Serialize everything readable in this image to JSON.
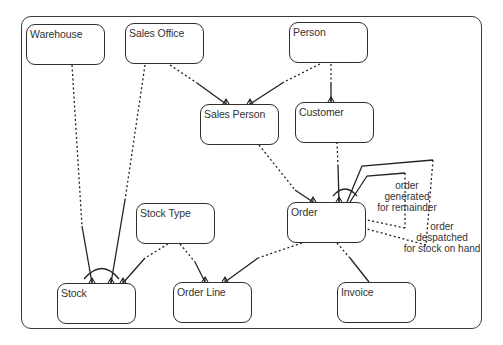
{
  "diagram": {
    "type": "entity-relationship",
    "notation": "Barker (dashed = optional, solid = mandatory, crow's foot = many, arc = exclusive)",
    "entities": [
      {
        "id": "warehouse",
        "label": "Warehouse"
      },
      {
        "id": "sales_office",
        "label": "Sales Office"
      },
      {
        "id": "person",
        "label": "Person"
      },
      {
        "id": "sales_person",
        "label": "Sales Person"
      },
      {
        "id": "customer",
        "label": "Customer"
      },
      {
        "id": "order",
        "label": "Order"
      },
      {
        "id": "stock_type",
        "label": "Stock Type"
      },
      {
        "id": "stock",
        "label": "Stock"
      },
      {
        "id": "order_line",
        "label": "Order Line"
      },
      {
        "id": "invoice",
        "label": "Invoice"
      }
    ],
    "relationships": [
      {
        "from": "Warehouse",
        "to": "Stock",
        "many_end": "Stock",
        "arc": "stock-arc"
      },
      {
        "from": "Sales Office",
        "to": "Stock",
        "many_end": "Stock",
        "arc": "stock-arc"
      },
      {
        "from": "Stock Type",
        "to": "Stock",
        "many_end": "Stock"
      },
      {
        "from": "Sales Office",
        "to": "Sales Person",
        "many_end": "Sales Person"
      },
      {
        "from": "Person",
        "to": "Sales Person",
        "many_end": "Sales Person"
      },
      {
        "from": "Person",
        "to": "Customer",
        "many_end": "Customer"
      },
      {
        "from": "Sales Person",
        "to": "Order",
        "many_end": "Order"
      },
      {
        "from": "Customer",
        "to": "Order",
        "many_end": "Order",
        "arc": "order-arc"
      },
      {
        "from": "Order",
        "to": "Order",
        "many_end": "Order",
        "arc": "order-arc",
        "label": "order generated for remainder"
      },
      {
        "from": "Order",
        "to": "Order",
        "many_end": "Order",
        "arc": "order-arc",
        "label": "order despatched for stock on hand"
      },
      {
        "from": "Stock Type",
        "to": "Order Line",
        "many_end": "Order Line"
      },
      {
        "from": "Order",
        "to": "Order Line",
        "many_end": "Order Line"
      },
      {
        "from": "Order",
        "to": "Invoice",
        "many_end": "Invoice"
      }
    ],
    "notes": {
      "remainder": [
        "order",
        "generated",
        "for remainder"
      ],
      "despatched": [
        "order",
        "despatched",
        "for stock on hand"
      ]
    },
    "colors": {
      "line": "#222222",
      "text": "#333333",
      "background": "#ffffff"
    }
  }
}
